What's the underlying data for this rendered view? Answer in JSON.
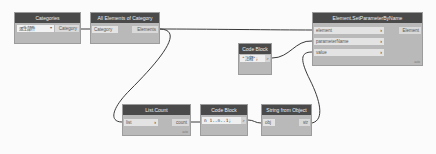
{
  "canvas": {
    "background": "#fbfbfb",
    "wire_color": "#3a3a3a",
    "header_color": "#4a4a4a",
    "node_body_color": "#b9b9b9"
  },
  "nodes": {
    "categories": {
      "title": "Categories",
      "dropdown_value": "派生部件",
      "output": "Category"
    },
    "all_elements": {
      "title": "All Elements of Category",
      "input": "Category",
      "output": "Elements"
    },
    "set_param": {
      "title": "Element.SetParameterByName",
      "inputs": [
        "element",
        "parameterName",
        "value"
      ],
      "output": "Element",
      "lacing": "auto"
    },
    "code_top": {
      "title": "Code Block",
      "code": "\"注释\";",
      "output": ">"
    },
    "list_count": {
      "title": "List.Count",
      "input": "list",
      "output": "count",
      "lacing": "auto"
    },
    "code_bottom": {
      "title": "Code Block",
      "code": "n 1..n..1;",
      "output": ">"
    },
    "string_from_obj": {
      "title": "String from Object",
      "input": "obj",
      "output": "str"
    }
  }
}
